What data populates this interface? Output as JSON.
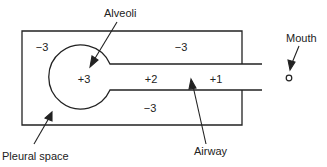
{
  "diagram": {
    "labels": {
      "alveoli": "Alveoli",
      "mouth": "Mouth",
      "pleural_space": "Pleural space",
      "airway": "Airway"
    },
    "pressures": {
      "pleural_top_left": "−3",
      "pleural_top_right": "−3",
      "pleural_bottom": "−3",
      "alveoli": "+3",
      "airway_proximal": "+2",
      "airway_distal": "+1"
    },
    "colors": {
      "line": "#222222",
      "background": "#ffffff"
    }
  }
}
